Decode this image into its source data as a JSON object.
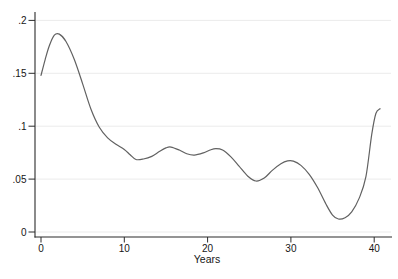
{
  "figure": {
    "width": 398,
    "height": 279,
    "background": "#ffffff"
  },
  "style": {
    "line_color": "#616161",
    "grid_color": "#ebebeb",
    "axis_color": "#2b2b2b",
    "text_color": "#161616"
  },
  "chart_data": {
    "type": "line",
    "title": "",
    "xlabel": "Years",
    "ylabel": "",
    "xlim": [
      0,
      41
    ],
    "ylim": [
      0,
      0.2
    ],
    "x_ticks": [
      0,
      10,
      20,
      30,
      40
    ],
    "x_tick_labels": [
      "0",
      "10",
      "20",
      "30",
      "40"
    ],
    "y_ticks": [
      0,
      0.05,
      0.1,
      0.15,
      0.2
    ],
    "y_tick_labels": [
      "0",
      ".05",
      ".1",
      ".15",
      ".2"
    ],
    "grid": "horizontal-y",
    "legend": "none",
    "series": [
      {
        "name": "density",
        "x": [
          0,
          0.5,
          1.0,
          1.6,
          2.2,
          3,
          4,
          5,
          6,
          7,
          8,
          9,
          10,
          10.7,
          11.4,
          12.3,
          13.3,
          14.2,
          15.0,
          15.6,
          16.6,
          17.5,
          18.4,
          19.5,
          20.3,
          21.0,
          21.8,
          22.8,
          23.8,
          24.8,
          25.8,
          26.8,
          27.8,
          28.8,
          29.6,
          30.3,
          31.2,
          32.2,
          33.2,
          34.2,
          35.0,
          35.7,
          36.5,
          37.3,
          38.2,
          39.0,
          39.7,
          40.2,
          40.7
        ],
        "y": [
          0.148,
          0.163,
          0.176,
          0.186,
          0.187,
          0.18,
          0.163,
          0.14,
          0.116,
          0.099,
          0.089,
          0.083,
          0.078,
          0.073,
          0.0685,
          0.069,
          0.0715,
          0.076,
          0.0795,
          0.0803,
          0.0775,
          0.074,
          0.0727,
          0.0748,
          0.0775,
          0.0788,
          0.0775,
          0.071,
          0.062,
          0.053,
          0.0482,
          0.051,
          0.0585,
          0.0645,
          0.0672,
          0.067,
          0.063,
          0.0545,
          0.042,
          0.0265,
          0.016,
          0.0123,
          0.0135,
          0.019,
          0.032,
          0.052,
          0.092,
          0.112,
          0.1165
        ]
      }
    ],
    "annotations": {
      "start_value": 0.148,
      "peak": {
        "x": 1.6,
        "y": 0.187
      },
      "deep_minimum": {
        "x": 35.7,
        "y": 0.0123
      },
      "end_value": 0.1165
    }
  }
}
